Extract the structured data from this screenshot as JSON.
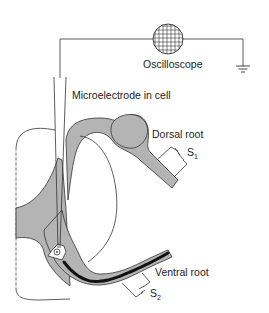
{
  "diagram": {
    "type": "experimental-setup",
    "labels": {
      "oscilloscope": "Oscilloscope",
      "microelectrode": "Microelectrode in cell",
      "dorsal_root": "Dorsal root",
      "ventral_root": "Ventral root",
      "stimulator_1": "S",
      "stimulator_1_sub": "1",
      "stimulator_2": "S",
      "stimulator_2_sub": "2"
    },
    "colors": {
      "tissue_fill": "#b4b4b4",
      "outline": "#333333",
      "axon": "#111111",
      "background": "#ffffff"
    }
  }
}
